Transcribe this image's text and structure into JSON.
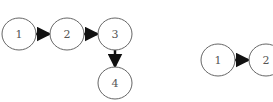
{
  "diagrams": [
    {
      "name": "left-graph",
      "nodes": [
        {
          "id": "1",
          "label": "1",
          "cx": 19,
          "cy": 34
        },
        {
          "id": "2",
          "label": "2",
          "cx": 67,
          "cy": 34
        },
        {
          "id": "3",
          "label": "3",
          "cx": 115,
          "cy": 34
        },
        {
          "id": "4",
          "label": "4",
          "cx": 115,
          "cy": 83
        }
      ],
      "edges": [
        [
          "1",
          "2"
        ],
        [
          "2",
          "3"
        ],
        [
          "3",
          "4"
        ]
      ]
    },
    {
      "name": "right-graph",
      "nodes": [
        {
          "id": "1",
          "label": "1",
          "cx": 218,
          "cy": 60
        },
        {
          "id": "2",
          "label": "2",
          "cx": 266,
          "cy": 60
        }
      ],
      "edges": [
        [
          "1",
          "2"
        ]
      ]
    }
  ],
  "colors": {
    "stroke": "#666666",
    "arrow": "#111111",
    "text": "#555555"
  }
}
